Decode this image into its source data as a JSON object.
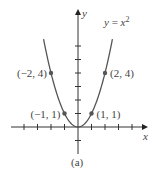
{
  "chart_data": {
    "type": "line",
    "title": "",
    "function": "y = x^2",
    "curve_label": "y = x²",
    "xlabel": "x",
    "ylabel": "y",
    "caption": "(a)",
    "xlim": [
      -5.5,
      5.3
    ],
    "ylim": [
      -2,
      8.5
    ],
    "grid": false,
    "x_ticks": [
      -4,
      -3,
      -2,
      -1,
      1,
      2,
      3,
      4
    ],
    "y_ticks": [
      -1,
      1,
      2,
      3,
      4,
      5,
      6
    ],
    "x": [
      -2.55,
      -2,
      -1.5,
      -1,
      -0.5,
      0,
      0.5,
      1,
      1.5,
      2,
      2.55
    ],
    "y": [
      6.5,
      4,
      2.25,
      1,
      0.25,
      0,
      0.25,
      1,
      2.25,
      4,
      6.5
    ],
    "points": [
      {
        "x": -2,
        "y": 4,
        "label": "(−2, 4)"
      },
      {
        "x": 2,
        "y": 4,
        "label": "(2, 4)"
      },
      {
        "x": -1,
        "y": 1,
        "label": "(−1, 1)"
      },
      {
        "x": 1,
        "y": 1,
        "label": "(1, 1)"
      }
    ],
    "colors": {
      "curve": "#555555",
      "axes": "#333333",
      "points": "#555555"
    }
  }
}
